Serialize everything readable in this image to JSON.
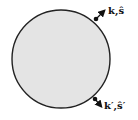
{
  "diagram": {
    "shape": "circle",
    "fill": "#e4e4e4",
    "stroke": "#222222",
    "labels": {
      "incoming": "k,ŝ",
      "outgoing": "k′,ŝ′"
    }
  }
}
